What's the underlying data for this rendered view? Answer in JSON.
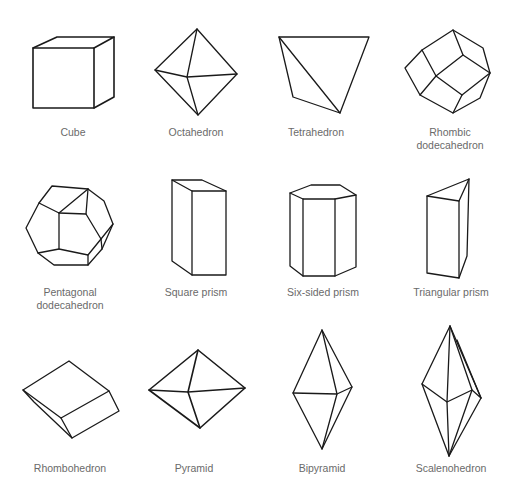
{
  "figure": {
    "background": "#ffffff",
    "line_color": "#1a1a1a",
    "label_color": "#6a6a6a",
    "crystal_forms": [
      {
        "name": "Cube",
        "row": 1,
        "col": 1
      },
      {
        "name": "Octahedron",
        "row": 1,
        "col": 2
      },
      {
        "name": "Tetrahedron",
        "row": 1,
        "col": 3
      },
      {
        "name": "Rhombic dodecahedron",
        "line1": "Rhombic",
        "line2": "dodecahedron",
        "row": 1,
        "col": 4
      },
      {
        "name": "Pentagonal dodecahedron",
        "line1": "Pentagonal",
        "line2": "dodecahedron",
        "row": 2,
        "col": 1
      },
      {
        "name": "Square prism",
        "row": 2,
        "col": 2
      },
      {
        "name": "Six-sided prism",
        "row": 2,
        "col": 3
      },
      {
        "name": "Triangular prism",
        "row": 2,
        "col": 4
      },
      {
        "name": "Rhombohedron",
        "row": 3,
        "col": 1
      },
      {
        "name": "Pyramid",
        "row": 3,
        "col": 2
      },
      {
        "name": "Bipyramid",
        "row": 3,
        "col": 3
      },
      {
        "name": "Scalenohedron",
        "row": 3,
        "col": 4
      }
    ]
  }
}
